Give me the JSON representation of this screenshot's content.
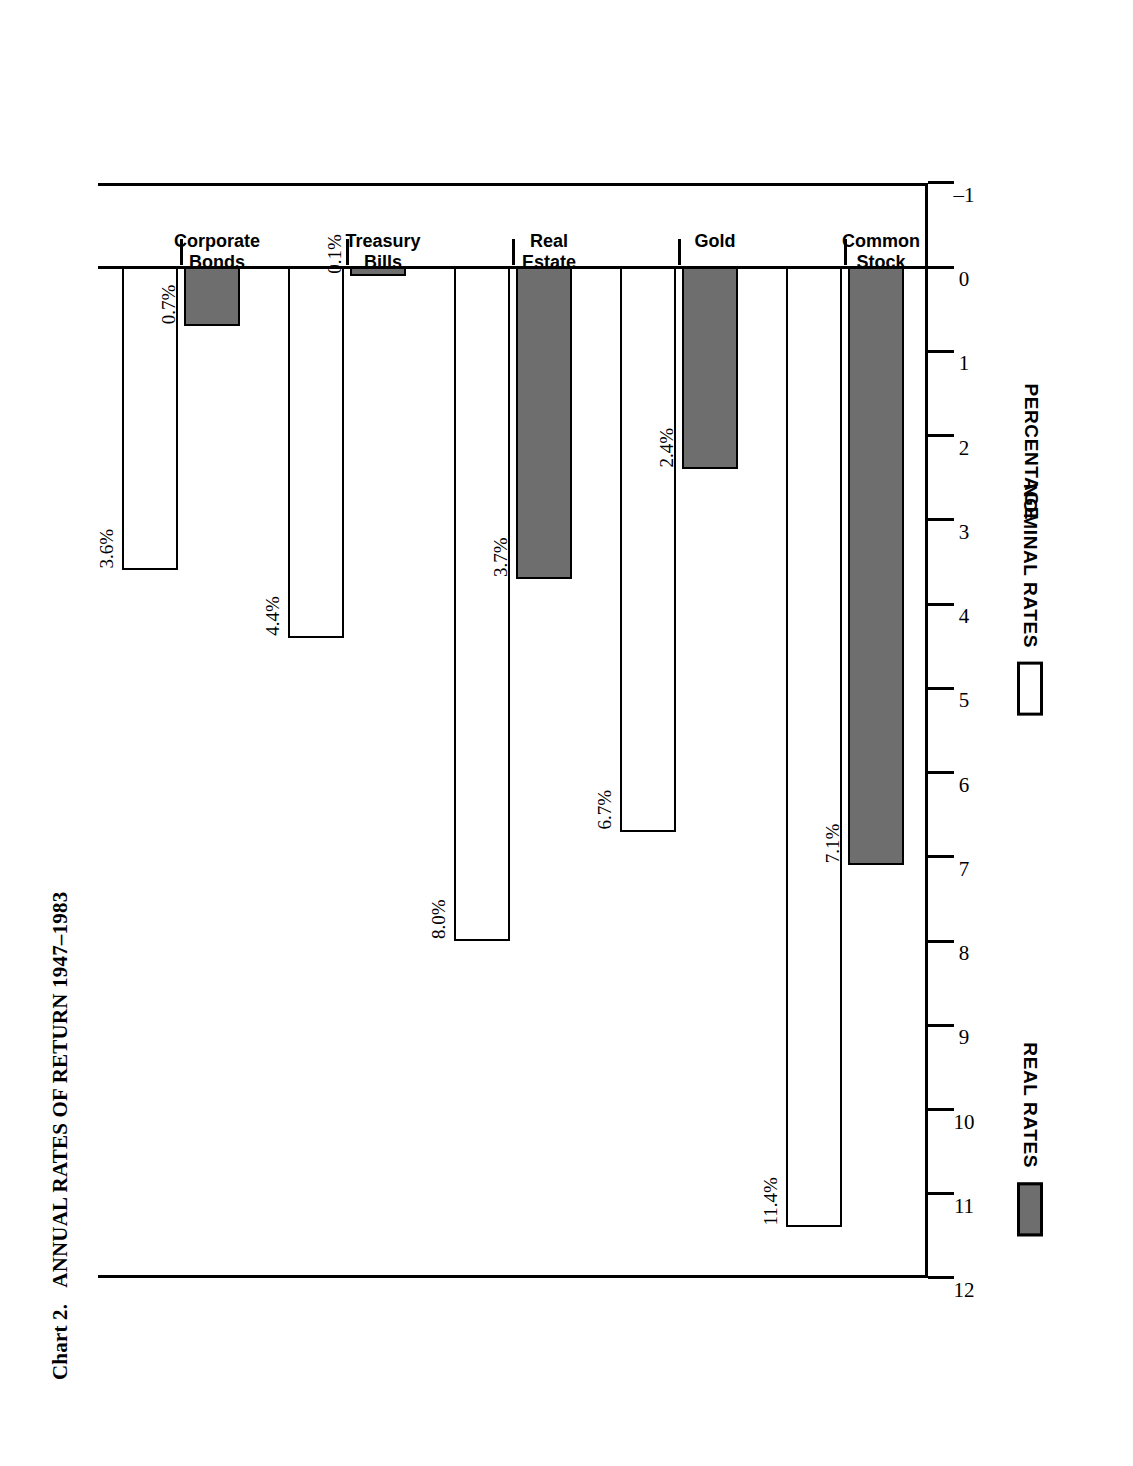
{
  "chart_data": {
    "type": "bar",
    "title_number": "Chart 2.",
    "title_text": "ANNUAL RATES OF RETURN 1947–1983",
    "orientation": "horizontal",
    "categories": [
      "Corporate\nBonds",
      "Treasury\nBills",
      "Real\nEstate",
      "Gold",
      "Common\nStock"
    ],
    "category_labels_flat": [
      "Corporate Bonds",
      "Treasury Bills",
      "Real Estate",
      "Gold",
      "Common Stock"
    ],
    "series": [
      {
        "name": "REAL RATES",
        "values": [
          0.7,
          0.1,
          3.7,
          2.4,
          7.1
        ],
        "labels": [
          "0.7%",
          "0.1%",
          "3.7%",
          "2.4%",
          "7.1%"
        ],
        "color": "#6e6e6e",
        "fill": "solid-gray"
      },
      {
        "name": "NOMINAL RATES",
        "values": [
          3.6,
          4.4,
          8.0,
          6.7,
          11.4
        ],
        "labels": [
          "3.6%",
          "4.4%",
          "8.0%",
          "6.7%",
          "11.4%"
        ],
        "color": "#ffffff",
        "fill": "outline-white"
      }
    ],
    "xlabel": "",
    "ylabel": "PERCENTAGE",
    "axis_title": "PERCENTAGE",
    "ylim": [
      -1,
      12
    ],
    "tick_values": [
      -1,
      0,
      1,
      2,
      3,
      4,
      5,
      6,
      7,
      8,
      9,
      10,
      11,
      12
    ],
    "tick_labels": [
      "–1",
      "0",
      "1",
      "2",
      "3",
      "4",
      "5",
      "6",
      "7",
      "8",
      "9",
      "10",
      "11",
      "12"
    ],
    "grid": false,
    "legend_position": "bottom",
    "legend": [
      {
        "label": "REAL RATES",
        "swatch": "real"
      },
      {
        "label": "NOMINAL RATES",
        "swatch": "nominal"
      }
    ]
  }
}
